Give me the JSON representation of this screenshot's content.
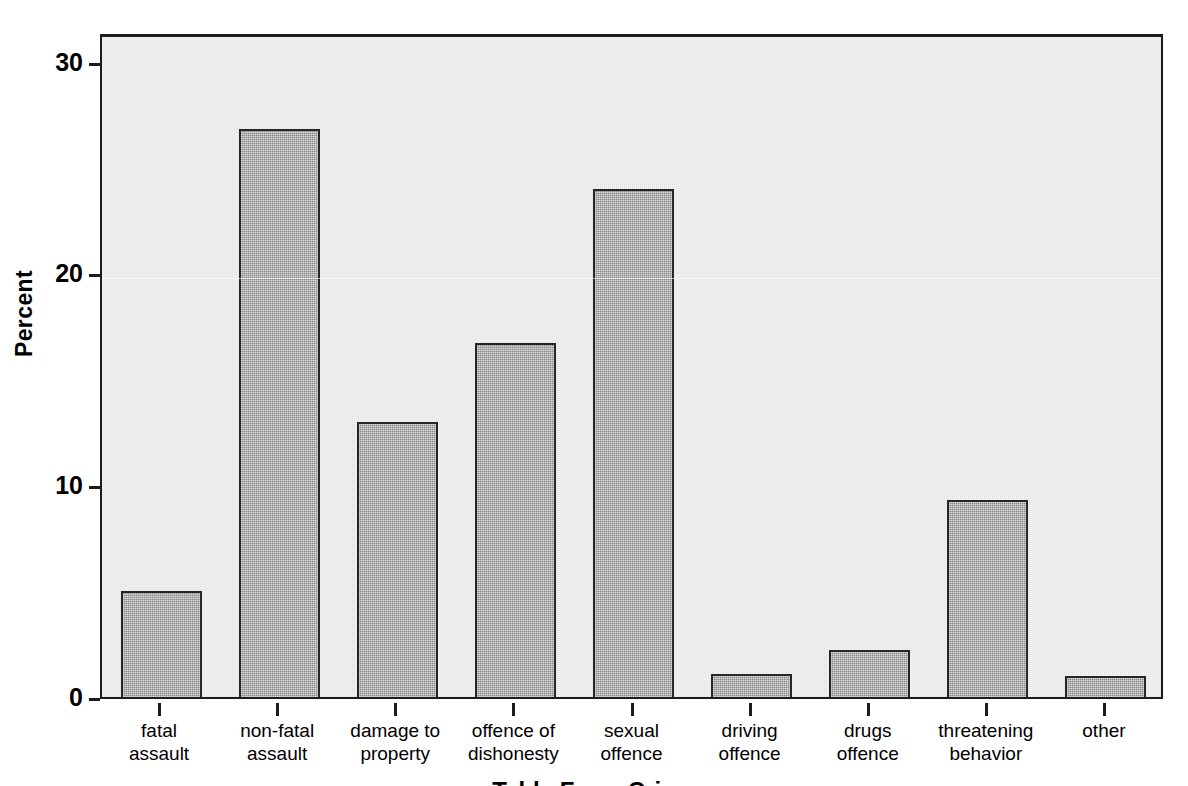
{
  "chart_data": {
    "type": "bar",
    "title": "",
    "subtitle": "",
    "xlabel": "",
    "ylabel": "Percent",
    "categories": [
      "fatal assault",
      "non-fatal assault",
      "damage to property",
      "offence of dishonesty",
      "sexual offence",
      "driving offence",
      "drugs offence",
      "threatening behavior",
      "other"
    ],
    "category_lines": [
      [
        "fatal",
        "assault"
      ],
      [
        "non-fatal",
        "assault"
      ],
      [
        "damage to",
        "property"
      ],
      [
        "offence of",
        "dishonesty"
      ],
      [
        "sexual",
        "offence"
      ],
      [
        "driving",
        "offence"
      ],
      [
        "drugs",
        "offence"
      ],
      [
        "threatening",
        "behavior"
      ],
      [
        "other",
        ""
      ]
    ],
    "values": [
      5.0,
      26.8,
      13.0,
      16.7,
      24.0,
      1.1,
      2.2,
      9.3,
      1.0
    ],
    "ylim": [
      0,
      31.4
    ],
    "yticks": [
      0,
      10,
      20,
      30
    ],
    "ytick_labels": [
      "0",
      "10",
      "20",
      "30"
    ],
    "grid": false,
    "legend": null,
    "legend_position": "none",
    "bar_fill_color": "#a9a9a9",
    "bar_border_color": "#262626",
    "plot_background_color": "#f2f2f2",
    "axis_color": "#1c1c1c",
    "text_color": "#000000"
  },
  "axis_title_bottom_partial": "Table Four: Crime",
  "figure": {
    "width": 1188,
    "height": 786
  }
}
